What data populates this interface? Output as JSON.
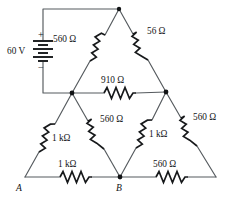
{
  "figure": {
    "type": "electrical-schematic",
    "title": "",
    "background_color": "#ffffff",
    "wire_color": "#555a5e",
    "symbol_color": "#17191b"
  },
  "source": {
    "name": "battery",
    "value": "60 V",
    "plus_sign": "+",
    "minus_sign": "−"
  },
  "nodes": [
    {
      "id": "apex",
      "label": "",
      "x": 119,
      "y": 9,
      "dot": true
    },
    {
      "id": "mid-left",
      "label": "",
      "x": 72,
      "y": 93,
      "dot": true
    },
    {
      "id": "mid-right",
      "label": "",
      "x": 166,
      "y": 92,
      "dot": true
    },
    {
      "id": "A",
      "label": "A",
      "x": 25,
      "y": 177,
      "dot": false
    },
    {
      "id": "B",
      "label": "B",
      "x": 120,
      "y": 177,
      "dot": true
    },
    {
      "id": "corner-right",
      "label": "",
      "x": 216,
      "y": 177,
      "dot": false
    }
  ],
  "resistors": [
    {
      "id": "r-upper-left",
      "value": "560 Ω",
      "from": "mid-left",
      "to": "apex"
    },
    {
      "id": "r-upper-right",
      "value": "56 Ω",
      "from": "apex",
      "to": "mid-right"
    },
    {
      "id": "r-middle-bridge",
      "value": "910 Ω",
      "from": "mid-left",
      "to": "mid-right"
    },
    {
      "id": "r-lower-left-outer",
      "value": "1 kΩ",
      "from": "A",
      "to": "mid-left"
    },
    {
      "id": "r-lower-left-inner",
      "value": "560 Ω",
      "from": "mid-left",
      "to": "B"
    },
    {
      "id": "r-lower-right-inner",
      "value": "1 kΩ",
      "from": "B",
      "to": "mid-right"
    },
    {
      "id": "r-lower-right-outer",
      "value": "560 Ω",
      "from": "mid-right",
      "to": "corner-right"
    },
    {
      "id": "r-bottom-left",
      "value": "1 kΩ",
      "from": "A",
      "to": "B"
    },
    {
      "id": "r-bottom-right",
      "value": "560 Ω",
      "from": "B",
      "to": "corner-right"
    }
  ],
  "labels": {
    "source_value": "60 V",
    "r_upper_left": "560 Ω",
    "r_upper_right": "56 Ω",
    "r_bridge": "910 Ω",
    "r_lower_left_outer": "1 kΩ",
    "r_lower_left_inner": "560 Ω",
    "r_lower_right_inner": "1 kΩ",
    "r_lower_right_outer": "560 Ω",
    "r_bottom_left": "1 kΩ",
    "r_bottom_right": "560 Ω",
    "node_a": "A",
    "node_b": "B",
    "plus": "+",
    "minus": "−"
  }
}
